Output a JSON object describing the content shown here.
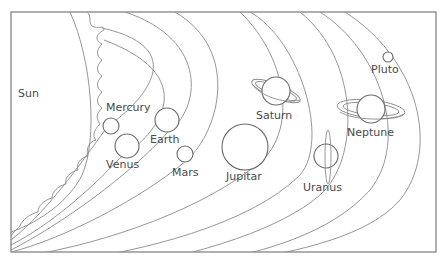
{
  "diagram": {
    "type": "labeled-illustration",
    "frame": {
      "x": 11,
      "y": 12,
      "width": 425,
      "height": 240
    },
    "line_color": "#8a8a8a",
    "label_color": "#4a4a4a",
    "labels": {
      "sun": "Sun",
      "mercury": "Mercury",
      "venus": "Venus",
      "earth": "Earth",
      "mars": "Mars",
      "jupiter": "Jupitar",
      "saturn": "Saturn",
      "uranus": "Uranus",
      "neptune": "Neptune",
      "pluto": "Pluto"
    },
    "bodies": [
      {
        "id": "sun",
        "name": "Sun",
        "label_pos": [
          18,
          97
        ]
      },
      {
        "id": "mercury",
        "name": "Mercury",
        "cx": 111,
        "cy": 126,
        "r": 8,
        "label_pos": [
          106,
          111
        ]
      },
      {
        "id": "venus",
        "name": "Venus",
        "cx": 127,
        "cy": 146,
        "r": 12,
        "label_pos": [
          106,
          168
        ]
      },
      {
        "id": "earth",
        "name": "Earth",
        "cx": 167,
        "cy": 120,
        "r": 12,
        "label_pos": [
          150,
          143
        ]
      },
      {
        "id": "mars",
        "name": "Mars",
        "cx": 185,
        "cy": 154,
        "r": 8,
        "label_pos": [
          172,
          176
        ]
      },
      {
        "id": "jupiter",
        "name": "Jupitar",
        "cx": 245,
        "cy": 147,
        "r": 23,
        "label_pos": [
          226,
          180
        ]
      },
      {
        "id": "saturn",
        "name": "Saturn",
        "cx": 276,
        "cy": 91,
        "r": 14,
        "rings": true,
        "label_pos": [
          256,
          119
        ]
      },
      {
        "id": "uranus",
        "name": "Uranus",
        "cx": 326,
        "cy": 156,
        "r": 12,
        "rings": "vertical",
        "label_pos": [
          303,
          191
        ]
      },
      {
        "id": "neptune",
        "name": "Neptune",
        "cx": 371,
        "cy": 109,
        "r": 14,
        "rings": true,
        "label_pos": [
          347,
          136
        ]
      },
      {
        "id": "pluto",
        "name": "Pluto",
        "cx": 388,
        "cy": 57,
        "r": 5,
        "label_pos": [
          371,
          73
        ]
      }
    ]
  }
}
